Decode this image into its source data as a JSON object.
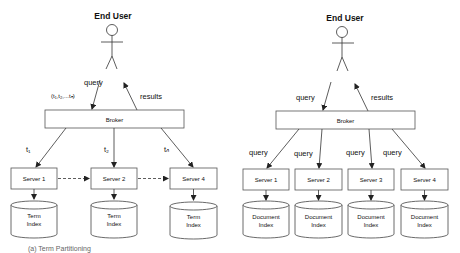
{
  "left_diagram": {
    "actor_label": "End User",
    "query_label": "query",
    "query_terms_label": "(t₁,t₂,...tₙ)",
    "results_label": "results",
    "broker_label": "Broker",
    "edge_labels": [
      "t₁",
      "t₂",
      "tₙ"
    ],
    "servers": [
      "Server 1",
      "Server 2",
      "Server 4"
    ],
    "index_line1": "Term",
    "index_line2": "Index",
    "caption": "(a) Term Partitioning"
  },
  "right_diagram": {
    "actor_label": "End User",
    "query_label": "query",
    "results_label": "results",
    "broker_label": "Broker",
    "edge_labels": [
      "query",
      "query",
      "query",
      "query"
    ],
    "servers": [
      "Server 1",
      "Server 2",
      "Server 3",
      "Server 4"
    ],
    "index_line1": "Document",
    "index_line2": "Index"
  }
}
